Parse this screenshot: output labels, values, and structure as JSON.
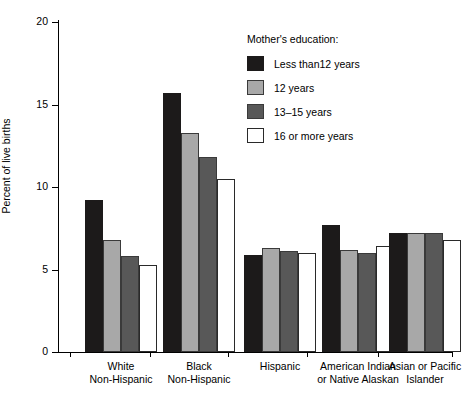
{
  "chart_data": {
    "type": "bar",
    "title": "",
    "xlabel": "",
    "ylabel": "Percent of live births",
    "ylim": [
      0,
      20
    ],
    "yticks": [
      0,
      5,
      10,
      15,
      20
    ],
    "grid": false,
    "legend_position": "top-right",
    "legend_title": "Mother's education:",
    "categories": [
      "White\nNon-Hispanic",
      "Black\nNon-Hispanic",
      "Hispanic",
      "American Indian\nor Native Alaskan",
      "Asian or Pacific\nIslander"
    ],
    "series": [
      {
        "name": "Less than12 years",
        "color": "#1c1a1a",
        "values": [
          9.2,
          15.7,
          5.9,
          7.7,
          7.2
        ]
      },
      {
        "name": "12 years",
        "color": "#a8a8a8",
        "values": [
          6.8,
          13.3,
          6.3,
          6.2,
          7.2
        ]
      },
      {
        "name": "13–15 years",
        "color": "#585858",
        "values": [
          5.8,
          11.8,
          6.1,
          6.0,
          7.2
        ]
      },
      {
        "name": "16 or more years",
        "color": "#ffffff",
        "values": [
          5.3,
          10.5,
          6.0,
          6.4,
          6.8
        ]
      }
    ]
  }
}
